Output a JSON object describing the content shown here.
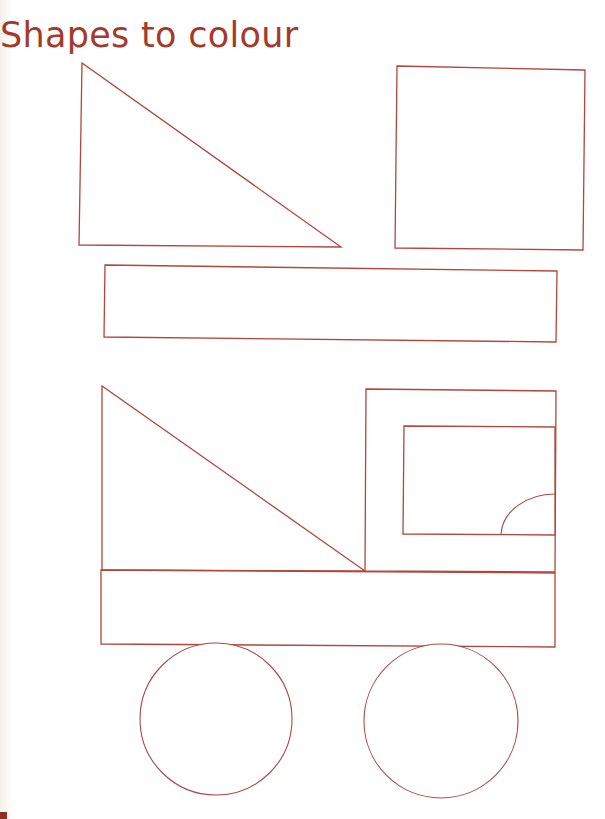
{
  "page": {
    "title": "Shapes to colour",
    "footer_text": "",
    "colors": {
      "ink": "#a33a2c",
      "outline": "#b0463c",
      "paper": "#ffffff"
    }
  },
  "shapes": [
    {
      "name": "triangle",
      "label": "Right triangle",
      "points": [
        [
          82,
          63
        ],
        [
          79,
          245
        ],
        [
          341,
          247
        ]
      ]
    },
    {
      "name": "square",
      "label": "Square",
      "points": [
        [
          397,
          66
        ],
        [
          585,
          70
        ],
        [
          583,
          250
        ],
        [
          395,
          248
        ]
      ]
    },
    {
      "name": "rectangle",
      "label": "Long rectangle",
      "points": [
        [
          105,
          265
        ],
        [
          557,
          271
        ],
        [
          556,
          342
        ],
        [
          104,
          337
        ]
      ]
    }
  ],
  "truck": {
    "load_triangle": {
      "points": [
        [
          102,
          386
        ],
        [
          102,
          570
        ],
        [
          365,
          571
        ]
      ]
    },
    "cab": {
      "points": [
        [
          366,
          389
        ],
        [
          556,
          391
        ],
        [
          555,
          572
        ],
        [
          365,
          571
        ]
      ]
    },
    "window": {
      "points": [
        [
          404,
          426
        ],
        [
          555,
          427
        ],
        [
          555,
          535
        ],
        [
          403,
          534
        ]
      ]
    },
    "window_quarter_circle": {
      "from": [
        501,
        534
      ],
      "to": [
        555,
        494
      ],
      "radius": 54
    },
    "body": {
      "points": [
        [
          101,
          570
        ],
        [
          555,
          573
        ],
        [
          555,
          647
        ],
        [
          101,
          644
        ]
      ]
    },
    "wheels": [
      {
        "name": "front-wheel",
        "cx": 216,
        "cy": 719,
        "r": 76
      },
      {
        "name": "rear-wheel",
        "cx": 441,
        "cy": 721,
        "r": 77
      }
    ]
  }
}
